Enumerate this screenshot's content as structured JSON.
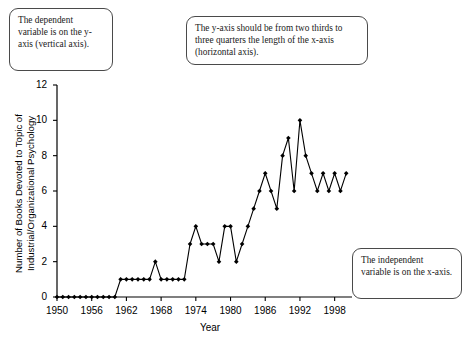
{
  "callouts": [
    {
      "id": "dependent",
      "text": "The dependent variable is on the y-axis (vertical axis)."
    },
    {
      "id": "yaxis_length",
      "text": "The y-axis should be from two thirds to three quarters the length of the x-axis (horizontal axis)."
    },
    {
      "id": "independent",
      "text": "The independent variable is on the x-axis."
    }
  ],
  "chart_data": {
    "type": "line",
    "title": "",
    "xlabel": "Year",
    "ylabel": "Number of Books Devoted to Topic of\nIndustrial/Organizational Psychology",
    "xlim": [
      1950,
      2001
    ],
    "ylim": [
      0,
      12
    ],
    "yticks": [
      0,
      2,
      4,
      6,
      8,
      10,
      12
    ],
    "ytick_labels": [
      "0",
      "2",
      "4",
      "6",
      "8",
      "10",
      "12"
    ],
    "xticks": [
      1950,
      1956,
      1962,
      1968,
      1974,
      1980,
      1986,
      1992,
      1998
    ],
    "xtick_labels": [
      "1950",
      "1956",
      "1962",
      "1968",
      "1974",
      "1980",
      "1986",
      "1992",
      "1998"
    ],
    "grid": false,
    "legend": false,
    "marker": "diamond",
    "line_color": "#000000",
    "marker_color": "#000000",
    "x": [
      1950,
      1951,
      1952,
      1953,
      1954,
      1955,
      1956,
      1957,
      1958,
      1959,
      1960,
      1961,
      1962,
      1963,
      1964,
      1965,
      1966,
      1967,
      1968,
      1969,
      1970,
      1971,
      1972,
      1973,
      1974,
      1975,
      1976,
      1977,
      1978,
      1979,
      1980,
      1981,
      1982,
      1983,
      1984,
      1985,
      1986,
      1987,
      1988,
      1989,
      1990,
      1991,
      1992,
      1993,
      1994,
      1995,
      1996,
      1997,
      1998,
      1999,
      2000
    ],
    "values": [
      0,
      0,
      0,
      0,
      0,
      0,
      0,
      0,
      0,
      0,
      0,
      1,
      1,
      1,
      1,
      1,
      1,
      2,
      1,
      1,
      1,
      1,
      1,
      3,
      4,
      3,
      3,
      3,
      2,
      4,
      4,
      2,
      3,
      4,
      5,
      6,
      7,
      6,
      5,
      8,
      9,
      6,
      10,
      8,
      7,
      6,
      7,
      6,
      7,
      6,
      7
    ],
    "series": [
      {
        "name": "Number of Books Devoted to Topic of Industrial/Organizational Psychology",
        "values": [
          0,
          0,
          0,
          0,
          0,
          0,
          0,
          0,
          0,
          0,
          0,
          1,
          1,
          1,
          1,
          1,
          1,
          2,
          1,
          1,
          1,
          1,
          1,
          3,
          4,
          3,
          3,
          3,
          2,
          4,
          4,
          2,
          3,
          4,
          5,
          6,
          7,
          6,
          5,
          8,
          9,
          6,
          10,
          8,
          7,
          6,
          7,
          6,
          7,
          6,
          7
        ]
      }
    ]
  }
}
